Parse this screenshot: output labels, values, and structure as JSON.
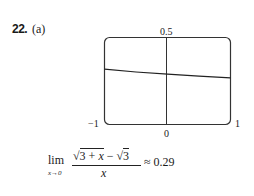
{
  "problem": {
    "number": "22.",
    "part": "(a)"
  },
  "chart_data": {
    "type": "line",
    "title": "",
    "xlabel": "",
    "ylabel": "",
    "xlim": [
      -1,
      1
    ],
    "ylim": [
      0,
      0.5
    ],
    "x_tick_labels": [
      "-1",
      "0",
      "1"
    ],
    "y_tick_labels": [
      "0.5"
    ],
    "grid": false,
    "series": [
      {
        "name": "f(x) = (sqrt(3+x) - sqrt(3))/x",
        "x": [
          -1,
          -0.5,
          0,
          0.5,
          1
        ],
        "y": [
          0.318,
          0.302,
          0.289,
          0.278,
          0.268
        ]
      }
    ]
  },
  "labels": {
    "y_top": "0.5",
    "x_left": "−1",
    "x_origin": "0",
    "x_right": "1"
  },
  "formula": {
    "lim": "lim",
    "sub": "x→0",
    "numerator_a": "3 + ",
    "numerator_x": "x",
    "numerator_b": " − ",
    "numerator_c": "3",
    "sqrt_symbol": "√",
    "denominator": "x",
    "result": "≈ 0.29"
  }
}
